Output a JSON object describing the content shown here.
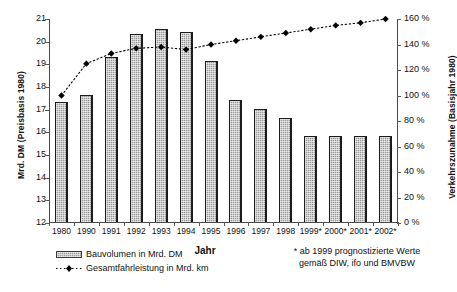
{
  "chart_data": {
    "type": "bar",
    "title": "",
    "xlabel": "Jahr",
    "categories": [
      "1980",
      "1990",
      "1991",
      "1992",
      "1993",
      "1994",
      "1995",
      "1996",
      "1997",
      "1998",
      "1999*",
      "2000*",
      "2001*",
      "2002*"
    ],
    "grid": false,
    "legend_position": "bottom-left",
    "series": [
      {
        "name": "Bauvolumen in Mrd. DM",
        "type": "bar",
        "axis": "left",
        "values": [
          17.3,
          17.6,
          19.3,
          20.3,
          20.5,
          20.4,
          19.1,
          17.4,
          17.0,
          16.6,
          15.8,
          15.8,
          15.8,
          15.8
        ]
      },
      {
        "name": "Gesamtfahrleistung in Mrd. km",
        "type": "line",
        "axis": "right",
        "values": [
          100,
          125,
          133,
          137,
          138,
          136,
          140,
          143,
          146,
          149,
          152,
          155,
          157,
          160
        ]
      }
    ],
    "left_axis": {
      "label": "Mrd. DM (Preisbasis 1980)",
      "ticks": [
        "12",
        "13",
        "14",
        "15",
        "16",
        "17",
        "18",
        "19",
        "20",
        "21"
      ],
      "min": 12,
      "max": 21
    },
    "right_axis": {
      "label": "Verkehrszunahme (Basisjahr 1980)",
      "ticks": [
        "0 %",
        "20 %",
        "40 %",
        "60 %",
        "80 %",
        "100 %",
        "120 %",
        "140 %",
        "160 %"
      ],
      "min": 0,
      "max": 160
    },
    "footnote_line1": "* ab 1999 prognostizierte Werte",
    "footnote_line2": "gemäß DIW, ifo und BMVBW",
    "colors": {
      "bar_fill": "#9a9a9a",
      "bar_border": "#1c1c1c",
      "line": "#000000",
      "axis": "#4a4a4a",
      "background": "#ffffff"
    }
  }
}
